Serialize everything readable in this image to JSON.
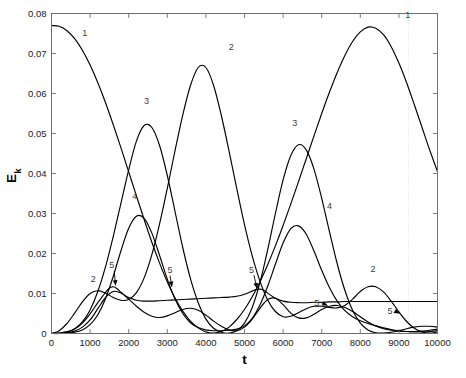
{
  "chart_data": {
    "type": "line",
    "title": "",
    "xlabel": "t",
    "ylabel": "E_k",
    "ylabel_base": "E",
    "ylabel_sub": "k",
    "xlim": [
      0,
      10000
    ],
    "ylim": [
      0,
      0.08
    ],
    "xticks": [
      0,
      1000,
      2000,
      3000,
      4000,
      5000,
      6000,
      7000,
      8000,
      9000,
      10000
    ],
    "xtick_labels": [
      "0",
      "1000",
      "2000",
      "3000",
      "4000",
      "5000",
      "6000",
      "7000",
      "8000",
      "9000",
      "10000"
    ],
    "yticks": [
      0,
      0.01,
      0.02,
      0.03,
      0.04,
      0.05,
      0.06,
      0.07,
      0.08
    ],
    "ytick_labels": [
      "0",
      "0.01",
      "0.02",
      "0.03",
      "0.04",
      "0.05",
      "0.06",
      "0.07",
      "0.08"
    ],
    "grid": false,
    "legend": "none",
    "line_color": "#000000",
    "axis_color": "#6e6e6e",
    "marker_line_color": "#d9d9d9",
    "marker_line_x": 9250,
    "series": [
      {
        "name": "1",
        "x": [
          0,
          200,
          400,
          600,
          800,
          1000,
          1200,
          1400,
          1600,
          1800,
          2000,
          2200,
          2400,
          2600,
          2800,
          3000,
          3200,
          3400,
          3600,
          3800,
          4000,
          4200,
          4400,
          4600,
          4800,
          5000,
          5200,
          5400,
          5600,
          5800,
          6000,
          6200,
          6400,
          6600,
          6800,
          7000,
          7200,
          7400,
          7600,
          7800,
          8000,
          8200,
          8400,
          8600,
          8800,
          9000,
          9200,
          9400,
          9600,
          9800,
          10000
        ],
        "y": [
          0.077,
          0.0768,
          0.0757,
          0.0737,
          0.0708,
          0.0671,
          0.0627,
          0.0577,
          0.0522,
          0.0464,
          0.0404,
          0.0344,
          0.0285,
          0.0228,
          0.0176,
          0.0129,
          0.0089,
          0.0056,
          0.0031,
          0.0014,
          0.0004,
          0.0001,
          0.0005,
          0.0016,
          0.0035,
          0.006,
          0.0092,
          0.0129,
          0.0172,
          0.0219,
          0.027,
          0.0324,
          0.038,
          0.0437,
          0.0494,
          0.055,
          0.0603,
          0.0652,
          0.0695,
          0.073,
          0.0754,
          0.0766,
          0.0763,
          0.0747,
          0.0717,
          0.0676,
          0.0627,
          0.0572,
          0.0515,
          0.0458,
          0.0405
        ]
      },
      {
        "name": "2",
        "x": [
          0,
          200,
          400,
          600,
          800,
          1000,
          1200,
          1400,
          1600,
          1800,
          2000,
          2200,
          2400,
          2600,
          2800,
          3000,
          3200,
          3400,
          3600,
          3800,
          4000,
          4200,
          4400,
          4600,
          4800,
          5000,
          5200,
          5400,
          5600,
          5800,
          6000,
          6200,
          6400,
          6600,
          6800,
          7000,
          7200,
          7400,
          7600,
          7800,
          8000,
          8200,
          8400,
          8600,
          8800,
          9000,
          9200,
          9400,
          9600,
          9800,
          10000
        ],
        "y": [
          0.0,
          0.0007,
          0.0025,
          0.0051,
          0.0079,
          0.01,
          0.0107,
          0.0101,
          0.009,
          0.0083,
          0.0085,
          0.0102,
          0.0139,
          0.0197,
          0.0274,
          0.0363,
          0.0457,
          0.0546,
          0.062,
          0.0665,
          0.0665,
          0.062,
          0.0545,
          0.0456,
          0.0362,
          0.0272,
          0.0194,
          0.0131,
          0.0084,
          0.0055,
          0.0042,
          0.0043,
          0.0052,
          0.0062,
          0.0068,
          0.0068,
          0.0065,
          0.0064,
          0.007,
          0.0086,
          0.0105,
          0.0117,
          0.0117,
          0.0104,
          0.0081,
          0.0054,
          0.003,
          0.0013,
          0.0004,
          0.0001,
          0.0004
        ]
      },
      {
        "name": "3",
        "x": [
          0,
          200,
          400,
          600,
          800,
          1000,
          1200,
          1400,
          1600,
          1800,
          2000,
          2200,
          2400,
          2600,
          2800,
          3000,
          3200,
          3400,
          3600,
          3800,
          4000,
          4200,
          4400,
          4600,
          4800,
          5000,
          5200,
          5400,
          5600,
          5800,
          6000,
          6200,
          6400,
          6600,
          6800,
          7000,
          7200,
          7400,
          7600,
          7800,
          8000,
          8200,
          8400,
          8600,
          8800,
          9000,
          9200,
          9400,
          9600,
          9800,
          10000
        ],
        "y": [
          0.0,
          0.0001,
          0.0004,
          0.0012,
          0.0029,
          0.0059,
          0.0105,
          0.0167,
          0.0243,
          0.0326,
          0.0409,
          0.0481,
          0.052,
          0.0515,
          0.047,
          0.0395,
          0.0305,
          0.0215,
          0.0137,
          0.0077,
          0.0036,
          0.0013,
          0.0003,
          0.0001,
          0.0007,
          0.0026,
          0.0065,
          0.0127,
          0.0209,
          0.03,
          0.0384,
          0.0445,
          0.0472,
          0.0459,
          0.0411,
          0.0338,
          0.0255,
          0.0175,
          0.0108,
          0.0058,
          0.0026,
          0.0009,
          0.0002,
          0.0001,
          0.0003,
          0.0007,
          0.0012,
          0.0016,
          0.0018,
          0.0018,
          0.0016
        ]
      },
      {
        "name": "4",
        "x": [
          0,
          200,
          400,
          600,
          800,
          1000,
          1200,
          1400,
          1600,
          1800,
          2000,
          2200,
          2400,
          2600,
          2800,
          3000,
          3200,
          3400,
          3600,
          3800,
          4000,
          4200,
          4400,
          4600,
          4800,
          5000,
          5200,
          5400,
          5600,
          5800,
          6000,
          6200,
          6400,
          6600,
          6800,
          7000,
          7200,
          7400,
          7600,
          7800,
          8000,
          8200,
          8400,
          8600,
          8800,
          9000,
          9200,
          9400,
          9600,
          9800,
          10000
        ],
        "y": [
          0.0,
          0.0,
          0.0001,
          0.0003,
          0.0009,
          0.0022,
          0.0047,
          0.0087,
          0.0143,
          0.0207,
          0.0263,
          0.0293,
          0.0288,
          0.0251,
          0.0195,
          0.0136,
          0.0086,
          0.005,
          0.0027,
          0.0015,
          0.0009,
          0.0007,
          0.0007,
          0.0008,
          0.0011,
          0.0019,
          0.0038,
          0.0071,
          0.0118,
          0.0173,
          0.0226,
          0.0262,
          0.0269,
          0.0248,
          0.0206,
          0.0158,
          0.0115,
          0.0081,
          0.0057,
          0.0042,
          0.0032,
          0.0025,
          0.0019,
          0.0014,
          0.001,
          0.0007,
          0.0005,
          0.0004,
          0.0004,
          0.0005,
          0.0007
        ]
      },
      {
        "name": "5",
        "x": [
          0,
          200,
          400,
          600,
          800,
          1000,
          1200,
          1400,
          1500,
          1600,
          1700,
          1800,
          1900,
          2000,
          2200,
          2400,
          2600,
          2800,
          3000,
          3200,
          3400,
          3600,
          3800,
          4000,
          4200,
          4400,
          4600,
          4800,
          5000,
          5200,
          5300,
          5400,
          5500,
          5600,
          5800,
          6000,
          6200,
          6400,
          6600,
          6800,
          7000,
          7200,
          7400,
          7600,
          7800,
          8000,
          8200,
          8400,
          8600,
          8800,
          9000,
          9200,
          9400,
          9600,
          9800,
          10000
        ],
        "y": [
          0.0,
          0.0001,
          0.0004,
          0.0011,
          0.0026,
          0.0049,
          0.0077,
          0.0103,
          0.0113,
          0.0117,
          0.0112,
          0.0103,
          0.0095,
          0.009,
          0.0083,
          0.0081,
          0.0081,
          0.0082,
          0.0083,
          0.0084,
          0.0085,
          0.0086,
          0.0087,
          0.0088,
          0.0089,
          0.009,
          0.0091,
          0.0093,
          0.0098,
          0.0106,
          0.011,
          0.0111,
          0.0108,
          0.0101,
          0.0088,
          0.0081,
          0.0078,
          0.0077,
          0.0077,
          0.0078,
          0.0078,
          0.0079,
          0.0079,
          0.008,
          0.008,
          0.008,
          0.008,
          0.008,
          0.008,
          0.008,
          0.008,
          0.008,
          0.008,
          0.008,
          0.008,
          0.008
        ]
      },
      {
        "name": "5b",
        "x": [
          0,
          200,
          400,
          600,
          800,
          1000,
          1200,
          1400,
          1600,
          1800,
          2000,
          2200,
          2400,
          2600,
          2800,
          3000,
          3200,
          3400,
          3600,
          3800,
          4000,
          4200,
          4400,
          4600,
          4800,
          5000,
          5200,
          5400,
          5600,
          5800,
          6000,
          6200,
          6400,
          6600,
          6800,
          7000,
          7200,
          7400,
          7600,
          7800,
          8000,
          8200,
          8400,
          8600,
          8800,
          9000,
          9200,
          9400,
          9600,
          9800,
          10000
        ],
        "y": [
          0.0,
          0.0,
          0.0002,
          0.0006,
          0.0016,
          0.0034,
          0.0062,
          0.009,
          0.0105,
          0.0101,
          0.0086,
          0.0068,
          0.0053,
          0.0043,
          0.004,
          0.0044,
          0.0052,
          0.006,
          0.0063,
          0.0058,
          0.0046,
          0.0031,
          0.0018,
          0.0009,
          0.0007,
          0.0016,
          0.0036,
          0.0063,
          0.0085,
          0.0088,
          0.0072,
          0.0051,
          0.0039,
          0.0039,
          0.0048,
          0.006,
          0.0068,
          0.007,
          0.0065,
          0.0055,
          0.0042,
          0.0029,
          0.0019,
          0.0012,
          0.0008,
          0.0006,
          0.0005,
          0.0005,
          0.0006,
          0.0008,
          0.0011
        ]
      }
    ],
    "annotations": [
      {
        "text": "1",
        "x": 860,
        "y": 0.0745,
        "arrow": "none"
      },
      {
        "text": "2",
        "x": 1080,
        "y": 0.0129,
        "arrow": "none"
      },
      {
        "text": "4",
        "x": 2160,
        "y": 0.0337,
        "arrow": "none"
      },
      {
        "text": "3",
        "x": 2460,
        "y": 0.0573,
        "arrow": "none"
      },
      {
        "text": "2",
        "x": 4660,
        "y": 0.071,
        "arrow": "none"
      },
      {
        "text": "3",
        "x": 6300,
        "y": 0.052,
        "arrow": "none"
      },
      {
        "text": "4",
        "x": 7200,
        "y": 0.0312,
        "arrow": "none"
      },
      {
        "text": "2",
        "x": 8330,
        "y": 0.0155,
        "arrow": "none"
      },
      {
        "text": "1",
        "x": 9230,
        "y": 0.079,
        "arrow": "none"
      },
      {
        "text": "5",
        "x": 1560,
        "y": 0.0163,
        "arrow": "down-left",
        "tip_x": 1660,
        "tip_y": 0.012
      },
      {
        "text": "5",
        "x": 3070,
        "y": 0.0151,
        "arrow": "down",
        "tip_x": 3120,
        "tip_y": 0.0117
      },
      {
        "text": "5",
        "x": 5180,
        "y": 0.0152,
        "arrow": "down-left",
        "tip_x": 5320,
        "tip_y": 0.0113
      },
      {
        "text": "5",
        "x": 6870,
        "y": 0.007,
        "arrow": "right",
        "tip_x": 7150,
        "tip_y": 0.007
      },
      {
        "text": "5",
        "x": 8770,
        "y": 0.005,
        "arrow": "right",
        "tip_x": 9010,
        "tip_y": 0.005
      }
    ]
  },
  "caption": {
    "text": ""
  }
}
